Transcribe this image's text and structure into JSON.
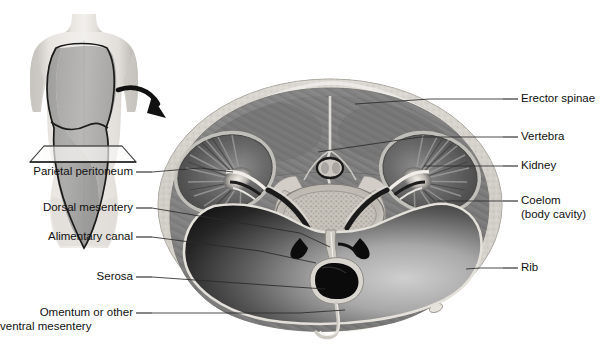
{
  "figure": {
    "orientation_note": "transverse section through abdomen"
  },
  "colors": {
    "background": "#ffffff",
    "text": "#111111",
    "leader_line": "#2a2a2a",
    "skin_outer": "#d8d5d0",
    "body_wall_muscle": "#8c8c8c",
    "erector_spinae": "#7a7a7a",
    "kidney_cortex": "#6e6e6e",
    "kidney_medulla": "#545454",
    "vertebral_body": "#cfcbc4",
    "trabecular_bone": "#b5b1a9",
    "coelom_dark": "#1d1d1d",
    "coelom_light": "#bdbdbd",
    "alimentary_canal": "#0a0a0a",
    "serosa_rim": "#d9d6d0",
    "mesentery": "#cfccc6",
    "torso_skin": "#c9c6c1",
    "torso_cavity_shade": "#9a9a9a",
    "arrow": "#111111"
  },
  "torso_inset": {
    "name": "human-torso-orientation-figure",
    "description": "anterior view of female torso with outlined body cavity and transverse cutting plane",
    "cutting_plane_label": "",
    "arrow_label": ""
  },
  "labels_left": [
    {
      "id": "parietal-peritoneum",
      "text": "Parietal peritoneum",
      "line2": "",
      "text_x": 133,
      "text_y": 176,
      "dash_from": [
        136,
        172
      ],
      "dash_to": [
        152,
        172
      ],
      "leader": [
        [
          152,
          172
        ],
        [
          200,
          168
        ],
        [
          233,
          172
        ]
      ]
    },
    {
      "id": "dorsal-mesentery",
      "text": "Dorsal mesentery",
      "line2": "",
      "text_x": 133,
      "text_y": 212,
      "dash_from": [
        136,
        208
      ],
      "dash_to": [
        152,
        208
      ],
      "leader": [
        [
          152,
          208
        ],
        [
          300,
          233
        ],
        [
          330,
          247
        ]
      ]
    },
    {
      "id": "alimentary-canal",
      "text": "Alimentary canal",
      "line2": "",
      "text_x": 133,
      "text_y": 241,
      "dash_from": [
        136,
        237
      ],
      "dash_to": [
        152,
        237
      ],
      "leader": [
        [
          152,
          237
        ],
        [
          260,
          251
        ],
        [
          316,
          263
        ]
      ]
    },
    {
      "id": "serosa",
      "text": "Serosa",
      "line2": "",
      "text_x": 133,
      "text_y": 281,
      "dash_from": [
        136,
        277
      ],
      "dash_to": [
        152,
        277
      ],
      "leader": [
        [
          152,
          277
        ],
        [
          280,
          286
        ],
        [
          325,
          289
        ]
      ]
    },
    {
      "id": "omentum-ventral-mesentery",
      "text": "Omentum or other",
      "line2": "ventral mesentery",
      "text_x": 133,
      "text_y": 317,
      "dash_from": [
        136,
        313
      ],
      "dash_to": [
        152,
        313
      ],
      "leader": [
        [
          152,
          313
        ],
        [
          300,
          313
        ],
        [
          345,
          310
        ]
      ]
    }
  ],
  "labels_right": [
    {
      "id": "erector-spinae",
      "text": "Erector spinae",
      "line2": "",
      "text_x": 521,
      "text_y": 103,
      "dash_from": [
        503,
        99
      ],
      "dash_to": [
        518,
        99
      ],
      "leader": [
        [
          503,
          99
        ],
        [
          430,
          99
        ],
        [
          355,
          104
        ]
      ]
    },
    {
      "id": "vertebra",
      "text": "Vertebra",
      "line2": "",
      "text_x": 521,
      "text_y": 141,
      "dash_from": [
        503,
        137
      ],
      "dash_to": [
        518,
        137
      ],
      "leader": [
        [
          503,
          137
        ],
        [
          420,
          137
        ],
        [
          318,
          152
        ]
      ]
    },
    {
      "id": "kidney",
      "text": "Kidney",
      "line2": "",
      "text_x": 521,
      "text_y": 170,
      "dash_from": [
        503,
        166
      ],
      "dash_to": [
        518,
        166
      ],
      "leader": [
        [
          503,
          166
        ],
        [
          450,
          166
        ],
        [
          424,
          166
        ]
      ]
    },
    {
      "id": "coelom-body-cavity",
      "text": "Coelom",
      "line2": "(body cavity)",
      "text_x": 521,
      "text_y": 205,
      "dash_from": [
        503,
        201
      ],
      "dash_to": [
        518,
        201
      ],
      "leader": [
        [
          503,
          201
        ],
        [
          460,
          201
        ],
        [
          437,
          201
        ]
      ]
    },
    {
      "id": "rib",
      "text": "Rib",
      "line2": "",
      "text_x": 521,
      "text_y": 272,
      "dash_from": [
        503,
        268
      ],
      "dash_to": [
        518,
        268
      ],
      "leader": [
        [
          503,
          268
        ],
        [
          480,
          268
        ],
        [
          466,
          269
        ]
      ]
    }
  ],
  "anatomy_parts": [
    {
      "id": "body-wall",
      "name": "body-wall"
    },
    {
      "id": "skin-fat-layer",
      "name": "skin-and-subcutaneous-fat"
    },
    {
      "id": "erector-spinae-left",
      "name": "erector-spinae-muscle-left"
    },
    {
      "id": "erector-spinae-right",
      "name": "erector-spinae-muscle-right"
    },
    {
      "id": "vertebral-body",
      "name": "vertebral-body"
    },
    {
      "id": "spinal-canal",
      "name": "spinal-canal"
    },
    {
      "id": "kidney-left",
      "name": "kidney-left"
    },
    {
      "id": "kidney-right",
      "name": "kidney-right"
    },
    {
      "id": "coelom-cavity",
      "name": "coelom-body-cavity"
    },
    {
      "id": "alimentary-canal-lumen",
      "name": "alimentary-canal"
    },
    {
      "id": "dorsal-mesentery-sheet",
      "name": "dorsal-mesentery"
    },
    {
      "id": "ventral-mesentery-sheet",
      "name": "ventral-mesentery-omentum"
    },
    {
      "id": "rib-left",
      "name": "rib-left"
    },
    {
      "id": "rib-right",
      "name": "rib-right"
    }
  ]
}
